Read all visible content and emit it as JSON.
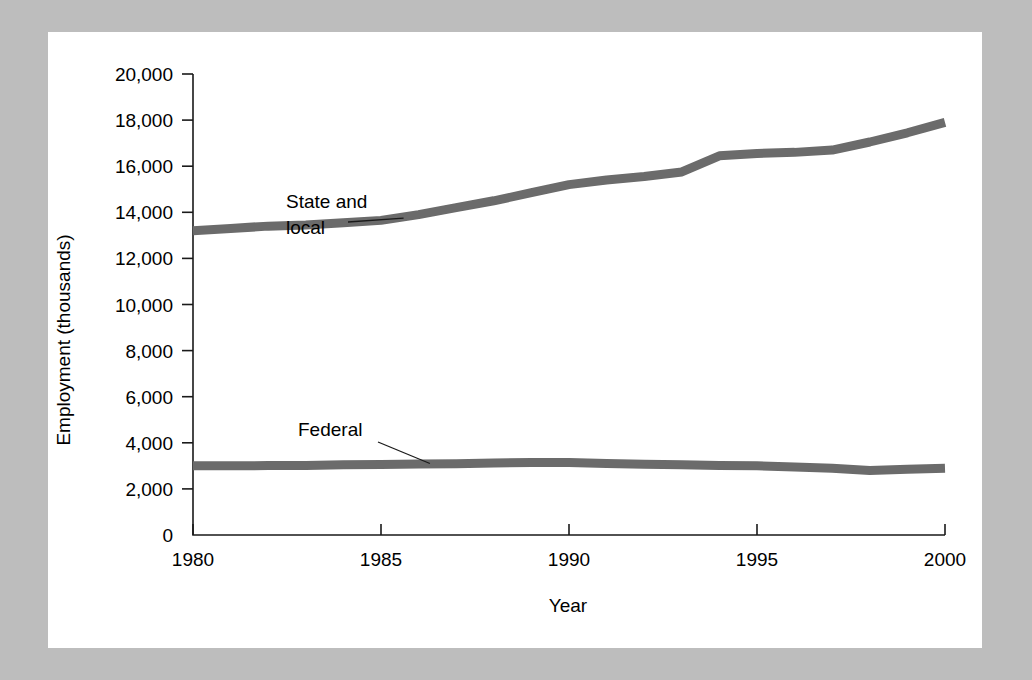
{
  "figure": {
    "background_color": "#bdbdbd",
    "panel_color": "#ffffff",
    "line_color": "#6b6b6b"
  },
  "chart_data": {
    "type": "line",
    "title": "",
    "subtitle": "",
    "xlabel": "Year",
    "ylabel": "Employment (thousands)",
    "xlim": [
      1980,
      2000
    ],
    "ylim": [
      0,
      20000
    ],
    "xticks": [
      1980,
      1985,
      1990,
      1995,
      2000
    ],
    "xtick_labels": [
      "1980",
      "1985",
      "1990",
      "1995",
      "2000"
    ],
    "yticks": [
      0,
      2000,
      4000,
      6000,
      8000,
      10000,
      12000,
      14000,
      16000,
      18000,
      20000
    ],
    "ytick_labels": [
      "0",
      "2,000",
      "4,000",
      "6,000",
      "8,000",
      "10,000",
      "12,000",
      "14,000",
      "16,000",
      "18,000",
      "20,000"
    ],
    "grid": false,
    "legend": "none",
    "annotations": [
      {
        "text_line_1": "State and",
        "text_line_2": "local",
        "points_to_year": 1985.6,
        "points_to_value": 13750
      },
      {
        "text_line_1": "Federal",
        "text_line_2": "",
        "points_to_year": 1986.3,
        "points_to_value": 3100
      }
    ],
    "x": [
      1980,
      1981,
      1982,
      1983,
      1984,
      1985,
      1986,
      1987,
      1988,
      1989,
      1990,
      1991,
      1992,
      1993,
      1994,
      1995,
      1996,
      1997,
      1998,
      1999,
      2000
    ],
    "series": [
      {
        "name": "State and local",
        "values": [
          13200,
          13300,
          13400,
          13450,
          13550,
          13650,
          13900,
          14200,
          14500,
          14850,
          15200,
          15400,
          15550,
          15750,
          16450,
          16550,
          16600,
          16700,
          17050,
          17450,
          17900
        ]
      },
      {
        "name": "Federal",
        "values": [
          3000,
          3000,
          3010,
          3020,
          3050,
          3060,
          3080,
          3090,
          3120,
          3150,
          3150,
          3100,
          3070,
          3050,
          3020,
          3000,
          2950,
          2900,
          2800,
          2850,
          2900
        ]
      }
    ]
  }
}
